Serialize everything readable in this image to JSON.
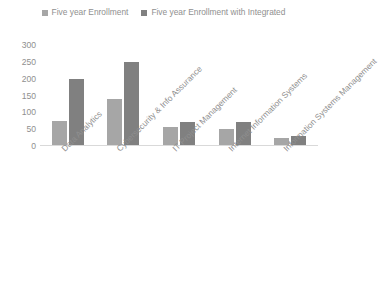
{
  "chart_data": {
    "type": "bar",
    "title": "",
    "subtitle": "",
    "xlabel": "",
    "ylabel": "",
    "ylim": [
      0,
      300
    ],
    "yticks": [
      300,
      250,
      200,
      150,
      100,
      50,
      0
    ],
    "grid": false,
    "legend_position": "top-center",
    "categories": [
      "Data Analytics",
      "Cybersecurity & Info Assurance",
      "IT Project Management",
      "Internet Information Systems",
      "Information Systems Management"
    ],
    "series": [
      {
        "name": "Five year Enrollment",
        "color": "#a6a6a6",
        "values": [
          75,
          140,
          55,
          50,
          25
        ]
      },
      {
        "name": "Five year Enrollment with Integrated",
        "color": "#808080",
        "values": [
          200,
          250,
          70,
          70,
          30
        ]
      }
    ]
  },
  "legend": {
    "entries": [
      {
        "label": "Five year Enrollment",
        "swatch_color": "#a6a6a6",
        "marker": "square-swatch-icon"
      },
      {
        "label": "Five year Enrollment with Integrated",
        "swatch_color": "#808080",
        "marker": "square-swatch-icon"
      }
    ]
  },
  "axis": {
    "y_ticks": [
      "300",
      "250",
      "200",
      "150",
      "100",
      "50",
      "0"
    ],
    "x_categories": [
      "Data Analytics",
      "Cybersecurity & Info Assurance",
      "IT Project Management",
      "Internet Information Systems",
      "Information Systems Management"
    ]
  },
  "colors": {
    "series_light": "#a6a6a6",
    "series_dark": "#808080",
    "axis_line": "#d9d9d9",
    "text": "#8f8f8f",
    "background": "#ffffff"
  }
}
